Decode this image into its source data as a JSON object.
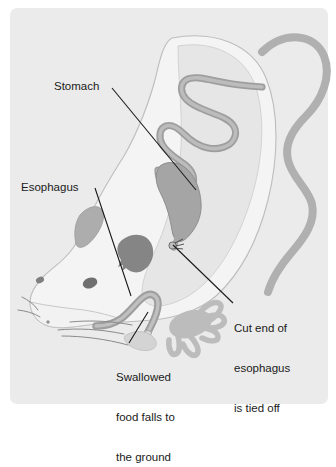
{
  "figure": {
    "panel_background": "#ebebeb",
    "page_background": "#ffffff",
    "line_color": "#1a1a1a",
    "body_fill": "#f2f2f2",
    "body_outline": "#b8b8b8",
    "cavity_fill": "#e3e3e3",
    "organ_fill": "#a9a9a9",
    "organ_outline": "#8e8e8e",
    "dark_marking_fill": "#848484",
    "tail_fill": "#b0b0b0",
    "foot_fill": "#bdbdbd"
  },
  "labels": {
    "stomach": "Stomach",
    "esophagus": "Esophagus",
    "cut_end_line1": "Cut end of",
    "cut_end_line2": "esophagus",
    "cut_end_line3": "is tied off",
    "swallowed_line1": "Swallowed",
    "swallowed_line2": "food falls to",
    "swallowed_line3": "the ground"
  },
  "anatomy": {
    "parts": [
      "rat-body",
      "rat-head",
      "rat-ear",
      "rat-eye",
      "rat-nose",
      "whiskers",
      "tail",
      "forefoot",
      "hindfoot",
      "body-cavity",
      "stomach",
      "intestine",
      "esophagus-tube",
      "cut-esophagus-end",
      "ligature-knot"
    ]
  },
  "leaders": [
    {
      "name": "stomach-leader",
      "from": [
        112,
        88
      ],
      "to": [
        196,
        190
      ]
    },
    {
      "name": "esophagus-leader",
      "from": [
        95,
        188
      ],
      "to": [
        131,
        296
      ]
    },
    {
      "name": "cut-end-leader",
      "from": [
        173,
        245
      ],
      "to": [
        233,
        303
      ]
    },
    {
      "name": "swallowed-leader",
      "from": [
        148,
        312
      ],
      "to": [
        129,
        343
      ]
    }
  ]
}
